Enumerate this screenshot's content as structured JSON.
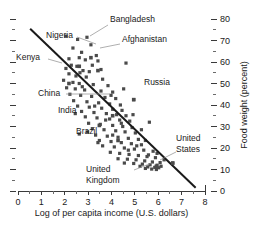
{
  "chart_data": {
    "type": "scatter",
    "title": "",
    "xlabel": "Log of per capita income (U.S. dollars)",
    "ylabel": "Food weight (percent)",
    "xlim": [
      0,
      8
    ],
    "ylim": [
      0,
      80
    ],
    "grid": false,
    "legend_position": "none",
    "x_ticks": [
      "0",
      "1",
      "2",
      "3",
      "4",
      "5",
      "6",
      "7",
      "8"
    ],
    "x_tick_values": [
      0,
      1,
      2,
      3,
      4,
      5,
      6,
      7,
      8
    ],
    "x_minor_step": 0.5,
    "y_ticks": [
      "0",
      "10",
      "20",
      "30",
      "40",
      "50",
      "60",
      "70",
      "80"
    ],
    "y_tick_values": [
      0,
      10,
      20,
      30,
      40,
      50,
      60,
      70,
      80
    ],
    "y_minor_step": 5,
    "y_axis_side": "right",
    "marker_shape": "square",
    "marker_color": "#4a4a4a",
    "trend_line": {
      "label": "regression line",
      "x0": 0.52,
      "y0": 75.5,
      "x1": 7.6,
      "y1": 1.5,
      "color": "#1a1a1a"
    },
    "points": [
      [
        2.05,
        72.0
      ],
      [
        2.55,
        70.5
      ],
      [
        2.95,
        71.5
      ],
      [
        3.12,
        68.0
      ],
      [
        2.35,
        66.5
      ],
      [
        2.72,
        64.5
      ],
      [
        3.35,
        63.0
      ],
      [
        2.62,
        62.0
      ],
      [
        2.88,
        61.0
      ],
      [
        3.42,
        60.5
      ],
      [
        4.62,
        59.5
      ],
      [
        2.28,
        58.5
      ],
      [
        2.52,
        58.0
      ],
      [
        2.05,
        57.0
      ],
      [
        2.78,
        56.0
      ],
      [
        3.05,
        55.5
      ],
      [
        2.18,
        54.5
      ],
      [
        2.48,
        53.5
      ],
      [
        2.92,
        53.0
      ],
      [
        3.62,
        52.0
      ],
      [
        1.95,
        51.5
      ],
      [
        2.35,
        50.5
      ],
      [
        2.62,
        50.0
      ],
      [
        3.22,
        49.5
      ],
      [
        3.85,
        49.0
      ],
      [
        2.08,
        48.0
      ],
      [
        2.45,
        47.5
      ],
      [
        2.85,
        47.0
      ],
      [
        3.55,
        46.5
      ],
      [
        4.05,
        46.0
      ],
      [
        2.22,
        45.0
      ],
      [
        2.68,
        44.5
      ],
      [
        3.15,
        44.0
      ],
      [
        3.72,
        43.5
      ],
      [
        4.18,
        43.0
      ],
      [
        4.95,
        42.5
      ],
      [
        2.38,
        42.0
      ],
      [
        2.95,
        41.5
      ],
      [
        3.45,
        41.0
      ],
      [
        3.92,
        40.5
      ],
      [
        4.38,
        40.0
      ],
      [
        2.55,
        39.5
      ],
      [
        3.05,
        39.0
      ],
      [
        3.58,
        38.5
      ],
      [
        4.05,
        38.0
      ],
      [
        4.45,
        37.5
      ],
      [
        2.72,
        37.0
      ],
      [
        3.25,
        36.5
      ],
      [
        3.78,
        36.0
      ],
      [
        4.22,
        35.5
      ],
      [
        4.62,
        35.0
      ],
      [
        2.88,
        34.5
      ],
      [
        3.38,
        34.0
      ],
      [
        3.92,
        33.5
      ],
      [
        4.35,
        33.0
      ],
      [
        4.78,
        32.5
      ],
      [
        5.62,
        32.0
      ],
      [
        3.02,
        31.5
      ],
      [
        3.52,
        31.0
      ],
      [
        4.05,
        30.5
      ],
      [
        4.48,
        30.0
      ],
      [
        4.88,
        29.5
      ],
      [
        3.18,
        29.0
      ],
      [
        3.68,
        28.5
      ],
      [
        4.18,
        28.0
      ],
      [
        4.58,
        27.5
      ],
      [
        5.02,
        27.0
      ],
      [
        2.62,
        26.5
      ],
      [
        3.32,
        26.0
      ],
      [
        3.82,
        25.5
      ],
      [
        4.28,
        25.0
      ],
      [
        4.72,
        24.5
      ],
      [
        5.15,
        24.0
      ],
      [
        3.48,
        23.5
      ],
      [
        3.98,
        23.0
      ],
      [
        4.42,
        22.5
      ],
      [
        4.85,
        22.0
      ],
      [
        5.28,
        21.5
      ],
      [
        3.62,
        21.0
      ],
      [
        4.12,
        20.5
      ],
      [
        4.55,
        20.0
      ],
      [
        4.98,
        19.5
      ],
      [
        5.38,
        19.0
      ],
      [
        5.78,
        18.5
      ],
      [
        3.95,
        18.0
      ],
      [
        4.35,
        17.5
      ],
      [
        4.75,
        17.0
      ],
      [
        5.15,
        16.5
      ],
      [
        5.52,
        16.0
      ],
      [
        5.88,
        15.5
      ],
      [
        4.28,
        15.0
      ],
      [
        4.68,
        14.8
      ],
      [
        5.05,
        14.5
      ],
      [
        5.42,
        14.0
      ],
      [
        5.75,
        13.5
      ],
      [
        6.08,
        13.2
      ],
      [
        4.55,
        13.0
      ],
      [
        4.95,
        12.8
      ],
      [
        5.32,
        12.5
      ],
      [
        5.65,
        12.2
      ],
      [
        5.95,
        12.0
      ],
      [
        6.62,
        13.0
      ],
      [
        5.22,
        11.5
      ],
      [
        5.55,
        11.2
      ],
      [
        5.85,
        11.0
      ],
      [
        6.02,
        10.8
      ],
      [
        5.45,
        10.5
      ],
      [
        5.72,
        10.2
      ],
      [
        5.92,
        10.0
      ],
      [
        6.12,
        11.5
      ],
      [
        5.58,
        16.8
      ],
      [
        5.95,
        17.5
      ],
      [
        4.42,
        31.5
      ],
      [
        5.28,
        28.5
      ],
      [
        3.75,
        33.0
      ],
      [
        3.28,
        39.5
      ],
      [
        2.75,
        48.5
      ],
      [
        3.98,
        44.5
      ],
      [
        4.52,
        47.5
      ],
      [
        2.45,
        36.0
      ],
      [
        2.98,
        27.5
      ],
      [
        3.42,
        22.5
      ],
      [
        4.05,
        26.0
      ],
      [
        4.72,
        19.0
      ],
      [
        5.08,
        21.0
      ],
      [
        5.45,
        23.5
      ],
      [
        6.25,
        14.5
      ],
      [
        2.18,
        61.5
      ],
      [
        2.65,
        55.0
      ],
      [
        3.18,
        58.5
      ],
      [
        3.55,
        56.5
      ],
      [
        4.92,
        35.5
      ]
    ],
    "annotations": [
      {
        "name": "bangladesh",
        "label": "Bangladesh",
        "label_x": 110,
        "label_y": 22,
        "anchor": "start",
        "leader": [
          [
            108,
            25
          ],
          [
            90,
            36
          ]
        ],
        "data_point": [
          3.12,
          62.0
        ]
      },
      {
        "name": "nigeria",
        "label": "Nigeria",
        "label_x": 46,
        "label_y": 38,
        "anchor": "start",
        "leader": [
          [
            77,
            37
          ],
          [
            96,
            44
          ]
        ],
        "data_point": [
          2.62,
          58.0
        ]
      },
      {
        "name": "afghanistan",
        "label": "Afghanistan",
        "label_x": 122,
        "label_y": 42,
        "anchor": "start",
        "leader": [
          [
            120,
            44
          ],
          [
            100,
            48
          ]
        ],
        "data_point": [
          3.42,
          56.0
        ]
      },
      {
        "name": "kenya",
        "label": "Kenya",
        "label_x": 16,
        "label_y": 60,
        "anchor": "start",
        "leader": [
          [
            48,
            59
          ],
          [
            62,
            63
          ]
        ],
        "data_point": [
          2.18,
          50.0
        ]
      },
      {
        "name": "russia",
        "label": "Russia",
        "label_x": 144,
        "label_y": 85,
        "anchor": "start",
        "leader": null,
        "data_point": [
          4.95,
          42.5
        ]
      },
      {
        "name": "china",
        "label": "China",
        "label_x": 38,
        "label_y": 96,
        "anchor": "start",
        "leader": [
          [
            66,
            94
          ],
          [
            110,
            94
          ]
        ],
        "data_point": [
          4.05,
          35.0
        ]
      },
      {
        "name": "india",
        "label": "India",
        "label_x": 58,
        "label_y": 113,
        "anchor": "start",
        "leader": null,
        "data_point": [
          3.48,
          30.5
        ]
      },
      {
        "name": "brazil",
        "label": "Brazil",
        "label_x": 76,
        "label_y": 134,
        "anchor": "start",
        "leader": null,
        "data_point": [
          4.28,
          23.5
        ]
      },
      {
        "name": "united-states",
        "label_line1": "United",
        "label_line2": "States",
        "label_x": 176,
        "label_y": 141,
        "anchor": "start",
        "leader": [
          [
            176,
            152
          ],
          [
            160,
            160
          ]
        ],
        "data_point": [
          6.62,
          13.0
        ]
      },
      {
        "name": "united-kingdom",
        "label_line1": "United",
        "label_line2": "Kingdom",
        "label_x": 86,
        "label_y": 172,
        "anchor": "start",
        "leader": [
          [
            134,
            170
          ],
          [
            152,
            163
          ]
        ],
        "data_point": [
          5.92,
          11.5
        ]
      }
    ]
  }
}
